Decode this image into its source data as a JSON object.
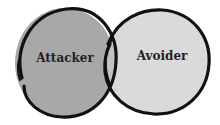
{
  "diagram": {
    "type": "venn",
    "sets": [
      {
        "id": "left",
        "label": "Attacker",
        "fill": "#a8a8a8"
      },
      {
        "id": "right",
        "label": "Avoider",
        "fill": "#dadada"
      }
    ],
    "overlap": {
      "fill": "#c2c2c2"
    },
    "stroke": "#111111"
  }
}
